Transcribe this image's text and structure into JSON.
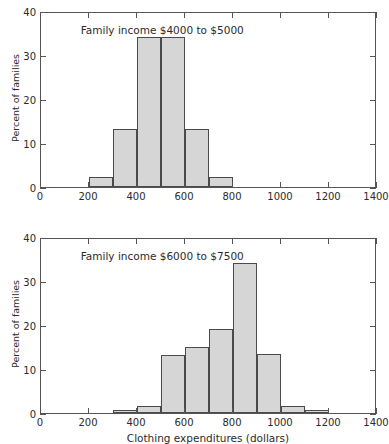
{
  "figure": {
    "background": "#ffffff",
    "bar_fill": "#d6d6d6",
    "bar_edge": "#4a4a4a",
    "axis_color": "#555555",
    "text_color": "#2b2b2b",
    "xlabel": "Clothing expenditures (dollars)",
    "ylabel": "Percent of families"
  },
  "chart_data": [
    {
      "type": "bar",
      "subtype": "histogram",
      "panel": "top",
      "title": "",
      "annotation": "Family income $4000 to $5000",
      "xlabel": "",
      "ylabel": "Percent of families",
      "xlim": [
        0,
        1400
      ],
      "ylim": [
        0,
        40
      ],
      "xticks": [
        0,
        200,
        400,
        600,
        800,
        1000,
        1200,
        1400
      ],
      "xticklabels": [
        "0",
        "200",
        "400",
        "600",
        "800",
        "1000",
        "1200",
        "1400"
      ],
      "yticks": [
        0,
        10,
        20,
        30,
        40
      ],
      "yticklabels": [
        "0",
        "10",
        "20",
        "30",
        "40"
      ],
      "grid": false,
      "legend": "none",
      "bin_width": 100,
      "bin_edges": [
        200,
        300,
        400,
        500,
        600,
        700,
        800
      ],
      "categories": [
        "200-300",
        "300-400",
        "400-500",
        "500-600",
        "600-700",
        "700-800"
      ],
      "values": [
        2.2,
        13.2,
        34.0,
        34.0,
        13.2,
        2.2
      ]
    },
    {
      "type": "bar",
      "subtype": "histogram",
      "panel": "bottom",
      "title": "",
      "annotation": "Family income $6000 to $7500",
      "xlabel": "Clothing expenditures (dollars)",
      "ylabel": "Percent of families",
      "xlim": [
        0,
        1400
      ],
      "ylim": [
        0,
        40
      ],
      "xticks": [
        0,
        200,
        400,
        600,
        800,
        1000,
        1200,
        1400
      ],
      "xticklabels": [
        "0",
        "200",
        "400",
        "600",
        "800",
        "1000",
        "1200",
        "1400"
      ],
      "yticks": [
        0,
        10,
        20,
        30,
        40
      ],
      "yticklabels": [
        "0",
        "10",
        "20",
        "30",
        "40"
      ],
      "grid": false,
      "legend": "none",
      "bin_width": 100,
      "bin_edges": [
        300,
        400,
        500,
        600,
        700,
        800,
        900,
        1000,
        1100,
        1200
      ],
      "categories": [
        "300-400",
        "400-500",
        "500-600",
        "600-700",
        "700-800",
        "800-900",
        "900-1000",
        "1000-1100",
        "1100-1200"
      ],
      "values": [
        0.6,
        1.5,
        13.2,
        15.0,
        19.0,
        34.0,
        13.3,
        1.5,
        0.6
      ]
    }
  ]
}
